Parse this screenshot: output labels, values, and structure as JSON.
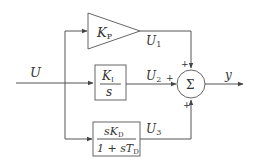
{
  "diagram": {
    "type": "PID controller block diagram",
    "input": {
      "label": "U"
    },
    "branches": [
      {
        "id": "proportional",
        "block": {
          "shape": "triangle",
          "gain": "K",
          "gain_sub": "P"
        },
        "output": {
          "label": "U",
          "sub": "1"
        },
        "sign": "+"
      },
      {
        "id": "integral",
        "block": {
          "shape": "box",
          "numerator": "K",
          "numerator_sub": "I",
          "denominator": "s"
        },
        "output": {
          "label": "U",
          "sub": "2"
        },
        "sign": "+"
      },
      {
        "id": "derivative",
        "block": {
          "shape": "box",
          "numerator": "sK",
          "numerator_sub": "D",
          "denominator": "1 + sT",
          "denominator_sub": "D"
        },
        "output": {
          "label": "U",
          "sub": "3"
        },
        "sign": "+"
      }
    ],
    "summing_junction": {
      "symbol": "Σ"
    },
    "output": {
      "label": "y"
    }
  }
}
